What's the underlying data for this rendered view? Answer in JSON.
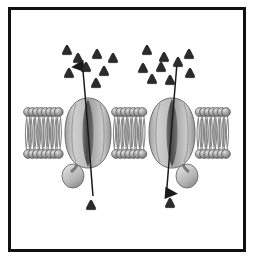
{
  "figure": {
    "frame": {
      "border_color": "#111111",
      "background": "#ffffff"
    }
  },
  "diagram": {
    "type": "biological-schematic",
    "palette": {
      "particle_fill": "#2b2b2b",
      "particle_stroke": "#111111",
      "head_fill": "#9a9a9a",
      "head_stroke": "#555555",
      "head_highlight": "#d8d8d8",
      "tail_color": "#7d7d7d",
      "protein_fill": "#c2c2c2",
      "protein_stroke": "#6b6b6b",
      "protein_shade": "#8f8f8f",
      "pore_dark": "#4a4a4a",
      "arrow_color": "#1a1a1a",
      "background": "#ffffff"
    },
    "membrane": {
      "label": "phospholipid bilayer",
      "x_start": 28,
      "x_end": 226,
      "top_heads_y": 112,
      "bottom_heads_y": 154,
      "head_radius": 4.4,
      "head_count_per_row": 46,
      "tail_top_y": 116,
      "tail_bottom_y": 150
    },
    "proteins": [
      {
        "name": "channel-protein-left",
        "cx": 88,
        "cy": 133,
        "width": 46,
        "height": 70,
        "pore_width": 9,
        "lobe": {
          "cx": 73,
          "cy": 176,
          "rx": 11,
          "ry": 12
        }
      },
      {
        "name": "channel-protein-right",
        "cx": 172,
        "cy": 133,
        "width": 46,
        "height": 70,
        "pore_width": 9,
        "lobe": {
          "cx": 187,
          "cy": 176,
          "rx": 11,
          "ry": 12
        }
      }
    ],
    "arrows": [
      {
        "name": "transport-arrow-left",
        "direction": "upward",
        "description": "molecules move out through left channel",
        "x1": 93,
        "y1": 196,
        "x2": 82,
        "y2": 62,
        "head_at": "start-top"
      },
      {
        "name": "transport-arrow-right",
        "direction": "downward",
        "description": "molecules move in through right channel",
        "x1": 177,
        "y1": 63,
        "x2": 166,
        "y2": 196,
        "head_at": "end-bottom"
      }
    ],
    "particles": {
      "label": "transported molecules (solute particles)",
      "shape": "rounded-triangle",
      "size": 11,
      "total_count": 19,
      "clusters": [
        {
          "name": "particle-cluster-upper-left",
          "region": "extracellular above left channel",
          "count": 8,
          "points": [
            [
              67,
              50
            ],
            [
              78,
              58
            ],
            [
              97,
              54
            ],
            [
              113,
              58
            ],
            [
              86,
              67
            ],
            [
              104,
              71
            ],
            [
              69,
              73
            ],
            [
              96,
              83
            ]
          ]
        },
        {
          "name": "particle-cluster-upper-right",
          "region": "extracellular above right channel",
          "count": 9,
          "points": [
            [
              147,
              50
            ],
            [
              164,
              57
            ],
            [
              189,
              54
            ],
            [
              143,
              68
            ],
            [
              161,
              67
            ],
            [
              178,
              62
            ],
            [
              152,
              79
            ],
            [
              170,
              80
            ],
            [
              190,
              73
            ]
          ]
        },
        {
          "name": "particle-cluster-lower",
          "region": "intracellular below membrane",
          "count": 2,
          "points": [
            [
              91,
              205
            ],
            [
              170,
              203
            ]
          ]
        }
      ]
    }
  }
}
